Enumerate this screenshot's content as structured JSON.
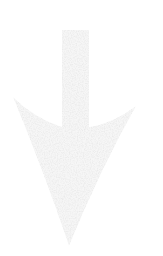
{
  "figure": {
    "type": "arrow",
    "direction": "down",
    "style": "stippled-noise",
    "base_fill": "#f6f6f6",
    "speck_gray": "0.76",
    "background": "#ffffff"
  }
}
